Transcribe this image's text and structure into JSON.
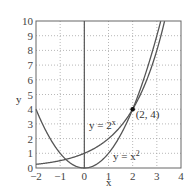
{
  "chart_data": {
    "type": "line",
    "title": "",
    "xlabel": "x",
    "ylabel": "y",
    "xlim": [
      -2,
      4
    ],
    "ylim": [
      0,
      10
    ],
    "grid": true,
    "grid_style": "dotted",
    "xticks": [
      -2,
      -1,
      0,
      1,
      2,
      3,
      4
    ],
    "xtick_labels": [
      "−2",
      "−1",
      "0",
      "1",
      "2",
      "3",
      "4"
    ],
    "yticks": [
      0,
      1,
      2,
      3,
      4,
      5,
      6,
      7,
      8,
      9,
      10
    ],
    "ytick_labels": [
      "0",
      "1",
      "2",
      "3",
      "4",
      "5",
      "6",
      "7",
      "8",
      "9",
      "10"
    ],
    "series": [
      {
        "name": "y = 2^x",
        "label": "y = 2",
        "label_sup": "x",
        "function": "2^x",
        "x": [
          -2,
          -1,
          0,
          1,
          2,
          3,
          3.32
        ],
        "y": [
          0.25,
          0.5,
          1,
          2,
          4,
          8,
          10
        ]
      },
      {
        "name": "y = x^2",
        "label": "y = x",
        "label_sup": "2",
        "function": "x^2",
        "x": [
          -2,
          -1,
          0,
          1,
          2,
          3,
          3.16
        ],
        "y": [
          4,
          1,
          0,
          1,
          4,
          9,
          10
        ]
      }
    ],
    "annotations": [
      {
        "text": "(2, 4)",
        "x": 2,
        "y": 4,
        "marker": "dot"
      }
    ],
    "legend": "none (inline curve labels)"
  },
  "colors": {
    "curve": "#555555",
    "axis": "#666666",
    "grid": "#9a9a9a",
    "point": "#111111"
  }
}
